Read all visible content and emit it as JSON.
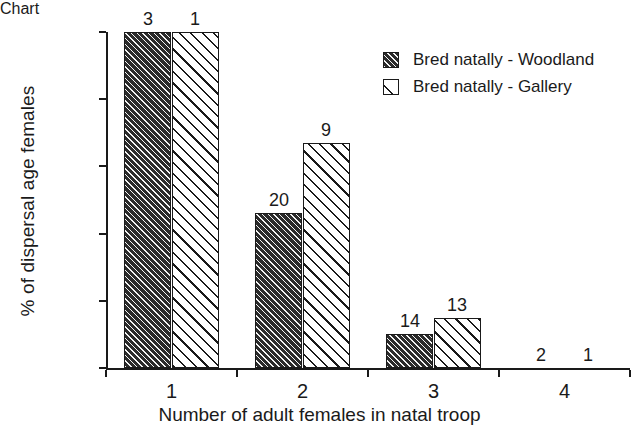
{
  "chart_data": {
    "type": "bar",
    "title": "",
    "xlabel": "Number of adult females in natal troop",
    "ylabel": "% of dispersal age females",
    "categories": [
      "1",
      "2",
      "3",
      "4"
    ],
    "ylim": [
      0,
      100
    ],
    "ytick_labels": [
      "0%",
      "20%",
      "40%",
      "60%",
      "80%",
      "100%"
    ],
    "ytick_values": [
      0,
      20,
      40,
      60,
      80,
      100
    ],
    "grid": false,
    "legend_position": "top-right",
    "series": [
      {
        "name": "Bred natally - Woodland",
        "pattern": "dense-diagonal-hatch-dark",
        "values": [
          100,
          46,
          10,
          0
        ],
        "point_labels": [
          "3",
          "20",
          "14",
          "2"
        ]
      },
      {
        "name": "Bred natally - Gallery",
        "pattern": "sparse-diagonal-hatch-white",
        "values": [
          100,
          67,
          15,
          0
        ],
        "point_labels": [
          "1",
          "9",
          "13",
          "1"
        ]
      }
    ]
  },
  "colors": {
    "ink": "#1a1a1a",
    "series_dark": "#2b2b2b",
    "series_light": "#ffffff",
    "background": "#ffffff"
  }
}
